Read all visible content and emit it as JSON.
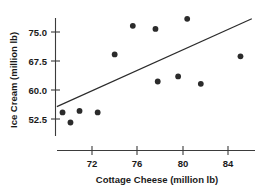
{
  "chart_data": {
    "type": "scatter",
    "title": "",
    "xlabel": "Cottage Cheese (million lb)",
    "ylabel": "Ice Cream (million lb)",
    "xlim": [
      68.6,
      86.8
    ],
    "ylim": [
      49.0,
      79.2
    ],
    "xticks": [
      72,
      76,
      80,
      84
    ],
    "xtick_labels": [
      "72",
      "76",
      "80",
      "84"
    ],
    "yticks": [
      52.5,
      60.0,
      67.5,
      75.0
    ],
    "ytick_labels": [
      "52.5",
      "60.0",
      "67.5",
      "75.0"
    ],
    "grid": false,
    "legend": null,
    "series": [
      {
        "name": "observations",
        "marker": "filled-circle",
        "color": "#2b2b2b",
        "points": [
          {
            "x": 69.4,
            "y": 54.2
          },
          {
            "x": 70.1,
            "y": 51.6
          },
          {
            "x": 70.9,
            "y": 54.6
          },
          {
            "x": 72.5,
            "y": 54.2
          },
          {
            "x": 74.0,
            "y": 69.2
          },
          {
            "x": 75.6,
            "y": 76.6
          },
          {
            "x": 77.8,
            "y": 62.2
          },
          {
            "x": 77.6,
            "y": 75.8
          },
          {
            "x": 79.6,
            "y": 63.5
          },
          {
            "x": 80.4,
            "y": 78.4
          },
          {
            "x": 81.6,
            "y": 61.6
          },
          {
            "x": 85.1,
            "y": 68.7
          }
        ]
      }
    ],
    "fit_line": {
      "name": "least-squares-line",
      "color": "#2b2b2b",
      "x_start": 68.9,
      "y_start": 55.7,
      "x_end": 86.1,
      "y_end": 78.4
    }
  },
  "axes": {
    "x_axis_name": "cottage-cheese-axis",
    "y_axis_name": "ice-cream-axis"
  }
}
